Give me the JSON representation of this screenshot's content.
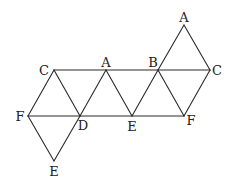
{
  "figure": {
    "type": "net-of-octahedron",
    "stroke_color": "#2a2a2a",
    "vertices": [
      {
        "id": "A_top",
        "label": "A",
        "x": 184,
        "y": 25
      },
      {
        "id": "C_left",
        "label": "C",
        "x": 54,
        "y": 70
      },
      {
        "id": "A_mid",
        "label": "A",
        "x": 106,
        "y": 70
      },
      {
        "id": "B",
        "label": "B",
        "x": 158,
        "y": 70
      },
      {
        "id": "C_right",
        "label": "C",
        "x": 210,
        "y": 70
      },
      {
        "id": "F_left",
        "label": "F",
        "x": 28,
        "y": 116
      },
      {
        "id": "D",
        "label": "D",
        "x": 80,
        "y": 116
      },
      {
        "id": "E_mid",
        "label": "E",
        "x": 132,
        "y": 116
      },
      {
        "id": "F_right",
        "label": "F",
        "x": 184,
        "y": 116
      },
      {
        "id": "E_bottom",
        "label": "E",
        "x": 54,
        "y": 161
      }
    ],
    "labels": [
      {
        "text": "A",
        "x": 184,
        "y": 22,
        "anchor": "middle"
      },
      {
        "text": "C",
        "x": 44,
        "y": 75,
        "anchor": "middle"
      },
      {
        "text": "A",
        "x": 106,
        "y": 67,
        "anchor": "middle"
      },
      {
        "text": "B",
        "x": 153,
        "y": 67,
        "anchor": "middle"
      },
      {
        "text": "C",
        "x": 217,
        "y": 75,
        "anchor": "middle"
      },
      {
        "text": "F",
        "x": 20,
        "y": 121,
        "anchor": "middle"
      },
      {
        "text": "D",
        "x": 83,
        "y": 130,
        "anchor": "middle"
      },
      {
        "text": "E",
        "x": 132,
        "y": 131,
        "anchor": "middle"
      },
      {
        "text": "F",
        "x": 191,
        "y": 125,
        "anchor": "middle"
      },
      {
        "text": "E",
        "x": 54,
        "y": 176,
        "anchor": "middle"
      }
    ]
  }
}
